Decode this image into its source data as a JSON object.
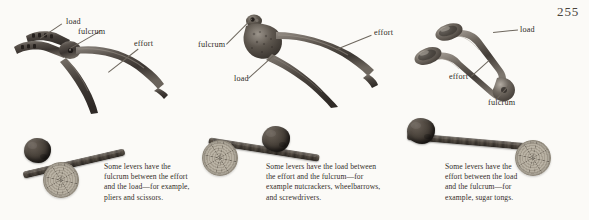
{
  "page": {
    "number": "255",
    "background_color": "#fbfaf7",
    "text_color": "#332e29"
  },
  "panels": [
    {
      "id": "first-class-lever",
      "tool_name": "pliers",
      "labels": [
        {
          "name": "load",
          "text": "load"
        },
        {
          "name": "fulcrum",
          "text": "fulcrum"
        },
        {
          "name": "effort",
          "text": "effort"
        }
      ],
      "caption_lines": [
        "Some levers have the",
        "fulcrum between the effort",
        "and the load—for example,",
        "pliers and scissors."
      ],
      "diagram": {
        "load_element": "rock",
        "fulcrum_element": "log-slice",
        "beam_element": "stick"
      }
    },
    {
      "id": "second-class-lever",
      "tool_name": "nutcracker",
      "labels": [
        {
          "name": "fulcrum",
          "text": "fulcrum"
        },
        {
          "name": "load",
          "text": "load"
        },
        {
          "name": "effort",
          "text": "effort"
        }
      ],
      "caption_lines": [
        "Some levers have the load between",
        "the effort and the fulcrum—for",
        "example nutcrackers, wheelbarrows,",
        "and screwdrivers."
      ],
      "diagram": {
        "load_element": "rock",
        "fulcrum_element": "log-slice",
        "beam_element": "stick"
      }
    },
    {
      "id": "third-class-lever",
      "tool_name": "sugar tongs",
      "labels": [
        {
          "name": "load",
          "text": "load"
        },
        {
          "name": "effort",
          "text": "effort"
        },
        {
          "name": "fulcrum",
          "text": "fulcrum"
        }
      ],
      "caption_lines": [
        "Some levers have the",
        "effort between the load",
        "and the fulcrum—for",
        "example, sugar tongs."
      ],
      "diagram": {
        "load_element": "rock",
        "fulcrum_element": "log-slice",
        "beam_element": "stick"
      }
    }
  ]
}
